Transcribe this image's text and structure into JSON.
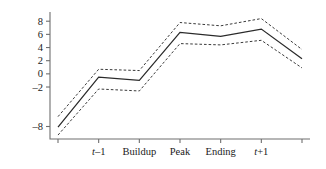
{
  "chart_data": {
    "type": "line",
    "title": "",
    "xlabel": "",
    "ylabel": "Percent of GDP",
    "grid": false,
    "legend": "none",
    "ylim": [
      -9.9,
      9.4
    ],
    "yticks": [
      8,
      6,
      4,
      2,
      0,
      -2,
      -8
    ],
    "ytick_labels": [
      "8",
      "6",
      "4",
      "2",
      "0",
      "–2",
      "–8"
    ],
    "categories": [
      "",
      "t–1",
      "Buildup",
      "Peak",
      "Ending",
      "t+1",
      ""
    ],
    "xtick_labels": [
      "",
      "t–1",
      "Buildup",
      "Peak",
      "Ending",
      "t+1",
      ""
    ],
    "series": [
      {
        "name": "Upper confidence bound",
        "style": "dashed",
        "values": [
          -6.5,
          0.7,
          0.5,
          7.8,
          7.3,
          8.4,
          3.7
        ]
      },
      {
        "name": "Mean",
        "style": "solid",
        "values": [
          -8.1,
          -0.5,
          -1.0,
          6.3,
          5.7,
          6.8,
          2.3
        ]
      },
      {
        "name": "Lower confidence bound",
        "style": "dashed",
        "values": [
          -9.3,
          -2.3,
          -2.6,
          4.6,
          4.4,
          5.1,
          0.9
        ]
      }
    ]
  },
  "axes": {
    "ylabel": "Percent of GDP",
    "ytick_labels": [
      "8",
      "6",
      "4",
      "2",
      "0",
      "–2",
      "–8"
    ],
    "xtick_labels": [
      "",
      "t–1",
      "Buildup",
      "Peak",
      "Ending",
      "t+1",
      ""
    ]
  },
  "colors": {
    "axis": "#6f6f6f",
    "center_line": "#2a2a2a",
    "band_line": "#3a3a3a",
    "text": "#1a1a1a",
    "background": "#ffffff"
  }
}
